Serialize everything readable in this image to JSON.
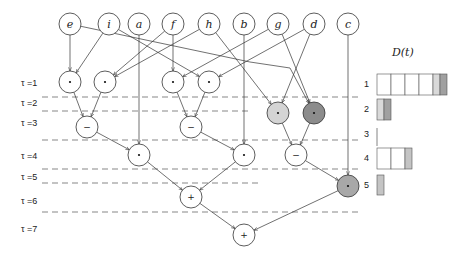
{
  "diagram": {
    "title": "D(t)",
    "inputs": [
      {
        "id": "e",
        "label": "e",
        "x": 70
      },
      {
        "id": "i",
        "label": "i",
        "x": 109
      },
      {
        "id": "a",
        "label": "a",
        "x": 139
      },
      {
        "id": "f",
        "label": "f",
        "x": 173
      },
      {
        "id": "h",
        "label": "h",
        "x": 209
      },
      {
        "id": "b",
        "label": "b",
        "x": 244
      },
      {
        "id": "g",
        "label": "g",
        "x": 278
      },
      {
        "id": "d",
        "label": "d",
        "x": 314
      },
      {
        "id": "c",
        "label": "c",
        "x": 348
      }
    ],
    "time_labels": [
      {
        "label": "τ =1",
        "y": 86
      },
      {
        "label": "τ =2",
        "y": 106
      },
      {
        "label": "τ =3",
        "y": 126
      },
      {
        "label": "τ =4",
        "y": 159
      },
      {
        "label": "τ =5",
        "y": 180
      },
      {
        "label": "τ =6",
        "y": 204
      },
      {
        "label": "τ =7",
        "y": 232
      }
    ],
    "ops": [
      {
        "id": "m1",
        "op": "·",
        "x": 70,
        "y": 82,
        "fill": "#ffffff"
      },
      {
        "id": "m2",
        "op": "·",
        "x": 105,
        "y": 82,
        "fill": "#ffffff"
      },
      {
        "id": "m3",
        "op": "·",
        "x": 173,
        "y": 82,
        "fill": "#ffffff"
      },
      {
        "id": "m4",
        "op": "·",
        "x": 209,
        "y": 82,
        "fill": "#ffffff"
      },
      {
        "id": "m5",
        "op": "·",
        "x": 278,
        "y": 113,
        "fill": "#d4d4d4"
      },
      {
        "id": "m6",
        "op": "·",
        "x": 314,
        "y": 113,
        "fill": "#8c8c8c"
      },
      {
        "id": "s1",
        "op": "−",
        "x": 87,
        "y": 127,
        "fill": "#ffffff"
      },
      {
        "id": "s2",
        "op": "−",
        "x": 191,
        "y": 127,
        "fill": "#ffffff"
      },
      {
        "id": "m7",
        "op": "·",
        "x": 139,
        "y": 155,
        "fill": "#ffffff"
      },
      {
        "id": "m8",
        "op": "·",
        "x": 244,
        "y": 155,
        "fill": "#ffffff"
      },
      {
        "id": "s3",
        "op": "−",
        "x": 296,
        "y": 155,
        "fill": "#ffffff"
      },
      {
        "id": "m9",
        "op": "·",
        "x": 348,
        "y": 186,
        "fill": "#a8a8a8"
      },
      {
        "id": "p1",
        "op": "+",
        "x": 191,
        "y": 197,
        "fill": "#ffffff"
      },
      {
        "id": "p2",
        "op": "+",
        "x": 244,
        "y": 235,
        "fill": "#ffffff"
      }
    ],
    "D_rows": [
      {
        "label": "1",
        "y": 74,
        "cells": [
          "#ffffff",
          "#ffffff",
          "#ffffff",
          "#ffffff",
          "#d9d9d9",
          "#a0a0a0"
        ],
        "widths": [
          14,
          14,
          14,
          14,
          7,
          7
        ]
      },
      {
        "label": "2",
        "y": 99,
        "cells": [
          "#d9d9d9",
          "#a0a0a0"
        ],
        "widths": [
          7,
          7
        ]
      },
      {
        "label": "3",
        "y": 124,
        "cells": [],
        "widths": []
      },
      {
        "label": "4",
        "y": 148,
        "cells": [
          "#ffffff",
          "#ffffff",
          "#c4c4c4"
        ],
        "widths": [
          14,
          14,
          7
        ]
      },
      {
        "label": "5",
        "y": 175,
        "cells": [
          "#c4c4c4"
        ],
        "widths": [
          7
        ]
      }
    ]
  }
}
